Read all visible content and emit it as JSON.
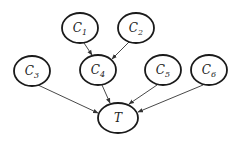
{
  "diagram": {
    "type": "directed-graph",
    "nodes": [
      {
        "id": "C1",
        "base": "C",
        "sub": "1",
        "cx": 80,
        "cy": 28
      },
      {
        "id": "C2",
        "base": "C",
        "sub": "2",
        "cx": 136,
        "cy": 28
      },
      {
        "id": "C3",
        "base": "C",
        "sub": "3",
        "cx": 32,
        "cy": 71
      },
      {
        "id": "C4",
        "base": "C",
        "sub": "4",
        "cx": 98,
        "cy": 70
      },
      {
        "id": "C5",
        "base": "C",
        "sub": "5",
        "cx": 163,
        "cy": 70
      },
      {
        "id": "C6",
        "base": "C",
        "sub": "6",
        "cx": 209,
        "cy": 70
      },
      {
        "id": "T",
        "base": "T",
        "sub": "",
        "cx": 118,
        "cy": 118
      }
    ],
    "edges": [
      {
        "from": "C1",
        "to": "C4"
      },
      {
        "from": "C2",
        "to": "C4"
      },
      {
        "from": "C3",
        "to": "T"
      },
      {
        "from": "C4",
        "to": "T"
      },
      {
        "from": "C5",
        "to": "T"
      },
      {
        "from": "C6",
        "to": "T"
      }
    ],
    "colors": {
      "stroke": "#1a1a1a",
      "edge": "#333333",
      "background": "#ffffff"
    }
  }
}
